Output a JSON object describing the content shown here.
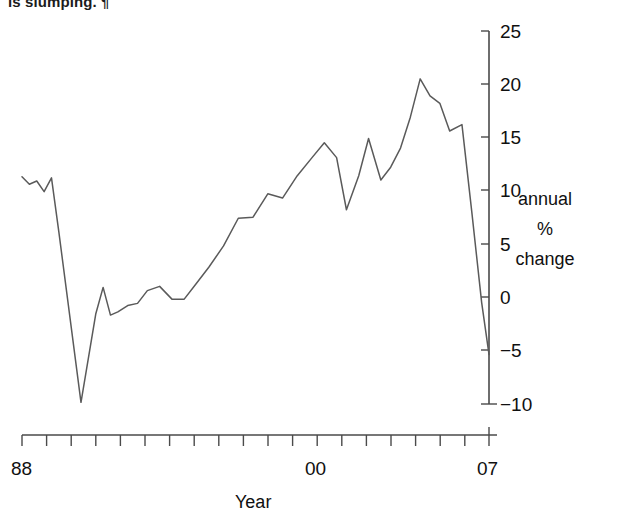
{
  "caption": {
    "fragment_text": "is slumping. ¶"
  },
  "chart_data": {
    "type": "line",
    "title": "",
    "xlabel": "Year",
    "ylabel": "annual % change",
    "ylabel_lines": [
      "annual",
      "%",
      "change"
    ],
    "xlim": [
      1988,
      2007
    ],
    "ylim": [
      -10,
      25
    ],
    "grid": false,
    "legend": null,
    "y_ticks": [
      25,
      20,
      15,
      10,
      5,
      0,
      -5,
      -10
    ],
    "y_tick_labels": [
      "25",
      "20",
      "15",
      "10",
      "5",
      "0",
      "−5",
      "−10"
    ],
    "x_ticks": [
      1988,
      1989,
      1990,
      1991,
      1992,
      1993,
      1994,
      1995,
      1996,
      1997,
      1998,
      1999,
      2000,
      2001,
      2002,
      2003,
      2004,
      2005,
      2006,
      2007
    ],
    "x_tick_labels": [
      "88",
      "",
      "",
      "",
      "",
      "",
      "",
      "",
      "",
      "",
      "",
      "",
      "00",
      "",
      "",
      "",
      "",
      "",
      "",
      "07"
    ],
    "x_labeled_ticks": [
      {
        "value": 1988,
        "label": "88"
      },
      {
        "value": 2000,
        "label": "00"
      },
      {
        "value": 2007,
        "label": "07"
      }
    ],
    "series": [
      {
        "name": "annual % change",
        "color": "#5a5a5a",
        "x": [
          1988.0,
          1988.3,
          1988.6,
          1988.9,
          1989.2,
          1989.5,
          1990.4,
          1991.0,
          1991.3,
          1991.6,
          1991.9,
          1992.3,
          1992.7,
          1993.1,
          1993.6,
          1994.1,
          1994.6,
          1995.1,
          1995.6,
          1996.2,
          1996.8,
          1997.4,
          1998.0,
          1998.6,
          1999.2,
          1999.8,
          2000.3,
          2000.8,
          2001.2,
          2001.7,
          2002.1,
          2002.6,
          2003.0,
          2003.4,
          2003.8,
          2004.2,
          2004.6,
          2005.0,
          2005.4,
          2005.9,
          2006.3,
          2006.7,
          2007.0
        ],
        "y": [
          11.3,
          10.6,
          10.9,
          9.9,
          11.2,
          6.1,
          -9.9,
          -1.6,
          0.9,
          -1.7,
          -1.4,
          -0.8,
          -0.6,
          0.6,
          1.0,
          -0.2,
          -0.2,
          1.3,
          2.8,
          4.8,
          7.4,
          7.5,
          9.7,
          9.3,
          11.4,
          13.1,
          14.5,
          13.1,
          8.2,
          11.4,
          14.9,
          11.0,
          12.2,
          14.0,
          16.9,
          20.5,
          18.9,
          18.2,
          15.6,
          16.2,
          8.0,
          -0.5,
          -5.4
        ]
      }
    ]
  }
}
